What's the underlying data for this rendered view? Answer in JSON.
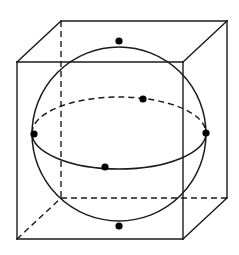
{
  "figure": {
    "width": 239,
    "height": 255,
    "background_color": "#ffffff",
    "line_color": "#1a1a1a",
    "dot_color": "#000000"
  },
  "style": {
    "cube_edge_width": 1.4,
    "cube_hidden_edge_width": 1.4,
    "cube_hidden_dash": "6,4",
    "sphere_outline_width": 1.5,
    "equator_front_width": 1.5,
    "equator_back_width": 1.5,
    "equator_back_dash": "6,4",
    "dot_radius": 3.6
  },
  "cube": {
    "label": "wireframe-cube",
    "front_face": {
      "top_left": [
        17,
        62
      ],
      "top_right": [
        183,
        62
      ],
      "bottom_right": [
        183,
        239
      ],
      "bottom_left": [
        17,
        239
      ]
    },
    "back_face": {
      "top_left": [
        61,
        21
      ],
      "top_right": [
        227,
        21
      ],
      "bottom_right": [
        227,
        198
      ],
      "bottom_left": [
        61,
        198
      ]
    },
    "projection_offset": [
      44,
      -41
    ],
    "visible_edges": [
      {
        "name": "front-top",
        "from": [
          17,
          62
        ],
        "to": [
          183,
          62
        ]
      },
      {
        "name": "front-right",
        "from": [
          183,
          62
        ],
        "to": [
          183,
          239
        ]
      },
      {
        "name": "front-bottom",
        "from": [
          17,
          239
        ],
        "to": [
          183,
          239
        ]
      },
      {
        "name": "front-left",
        "from": [
          17,
          62
        ],
        "to": [
          17,
          239
        ]
      },
      {
        "name": "back-top",
        "from": [
          61,
          21
        ],
        "to": [
          227,
          21
        ]
      },
      {
        "name": "back-right",
        "from": [
          227,
          21
        ],
        "to": [
          227,
          198
        ]
      },
      {
        "name": "edge-top-left-receding",
        "from": [
          17,
          62
        ],
        "to": [
          61,
          21
        ]
      },
      {
        "name": "edge-top-right-receding",
        "from": [
          183,
          62
        ],
        "to": [
          227,
          21
        ]
      },
      {
        "name": "edge-bottom-right-receding",
        "from": [
          183,
          239
        ],
        "to": [
          227,
          198
        ]
      }
    ],
    "hidden_edges": [
      {
        "name": "back-left-vertical",
        "from": [
          61,
          21
        ],
        "to": [
          61,
          198
        ]
      },
      {
        "name": "back-bottom",
        "from": [
          61,
          198
        ],
        "to": [
          227,
          198
        ]
      },
      {
        "name": "edge-bottom-left-receding",
        "from": [
          17,
          239
        ],
        "to": [
          61,
          198
        ]
      }
    ]
  },
  "sphere": {
    "label": "inscribed-sphere",
    "center": [
      119,
      134
    ],
    "radius": 87
  },
  "equator": {
    "label": "equatorial-ellipse",
    "center": [
      119,
      133
    ],
    "rx": 87,
    "ry": 36,
    "front_half_visible": true,
    "back_half_hidden": true
  },
  "points": [
    {
      "name": "north-pole",
      "x": 119,
      "y": 41,
      "position": "top"
    },
    {
      "name": "south-pole",
      "x": 119,
      "y": 226,
      "position": "bottom"
    },
    {
      "name": "equator-left",
      "x": 34,
      "y": 134,
      "position": "left"
    },
    {
      "name": "equator-right",
      "x": 206,
      "y": 133,
      "position": "right"
    },
    {
      "name": "equator-back",
      "x": 143,
      "y": 99,
      "position": "back"
    },
    {
      "name": "equator-front",
      "x": 105,
      "y": 167,
      "position": "front"
    }
  ]
}
